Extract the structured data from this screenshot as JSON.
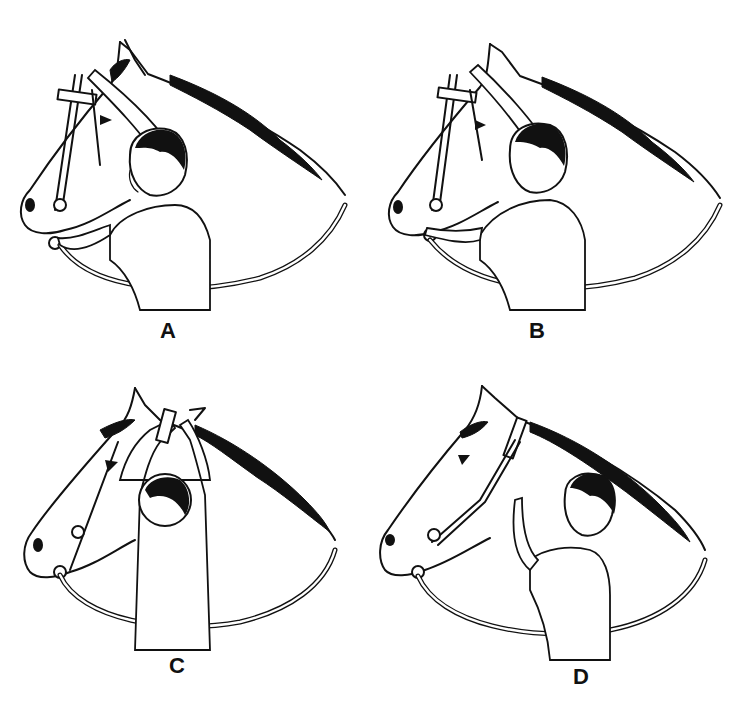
{
  "figure": {
    "panels": [
      {
        "id": "A",
        "label": "A",
        "caption_position": {
          "x": 168,
          "y": 330
        },
        "action": "holding bridle headstall up with right hand, guiding bit with left hand"
      },
      {
        "id": "B",
        "label": "B",
        "caption_position": {
          "x": 537,
          "y": 330
        },
        "action": "easing bit into horse's mouth with left hand while holding headstall"
      },
      {
        "id": "C",
        "label": "C",
        "caption_position": {
          "x": 177,
          "y": 665
        },
        "action": "sliding crownpiece over the horse's ears with both hands (viewed from behind)"
      },
      {
        "id": "D",
        "label": "D",
        "caption_position": {
          "x": 581,
          "y": 676
        },
        "action": "fastening the throatlatch buckle"
      }
    ],
    "colors": {
      "ink": "#111111",
      "background": "#ffffff"
    }
  }
}
